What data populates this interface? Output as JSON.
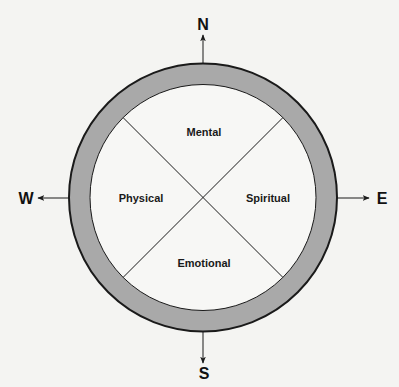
{
  "diagram": {
    "title": "",
    "directions": {
      "north": "N",
      "south": "S",
      "west": "W",
      "east": "E"
    },
    "quadrants": {
      "top": "Mental",
      "left": "Physical",
      "right": "Spiritual",
      "bottom": "Emotional"
    },
    "colors": {
      "background": "#f4f4f2",
      "ring_fill": "#a9a9a9",
      "inner_fill": "#f7f7f5",
      "stroke": "#1a1a1a"
    }
  }
}
